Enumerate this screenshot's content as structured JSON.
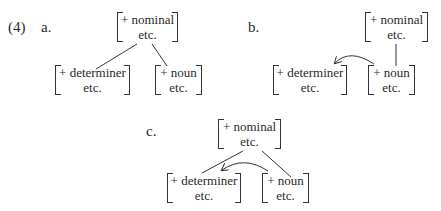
{
  "example": {
    "number": "(4)",
    "panels": [
      {
        "label": "a.",
        "top": {
          "feature": "+ nominal",
          "rest": "etc."
        },
        "left": {
          "feature": "+ determiner",
          "rest": "etc."
        },
        "right": {
          "feature": "+ noun",
          "rest": "etc."
        },
        "relation": "nominal dominates determiner and noun"
      },
      {
        "label": "b.",
        "top": {
          "feature": "+ nominal",
          "rest": "etc."
        },
        "left": {
          "feature": "+ determiner",
          "rest": "etc."
        },
        "right": {
          "feature": "+ noun",
          "rest": "etc."
        },
        "relation": "nominal dominates noun; arrow from noun to determiner"
      },
      {
        "label": "c.",
        "top": {
          "feature": "+ nominal",
          "rest": "etc."
        },
        "left": {
          "feature": "+ determiner",
          "rest": "etc."
        },
        "right": {
          "feature": "+ noun",
          "rest": "etc."
        },
        "relation": "nominal dominates determiner and noun; arrow from noun to determiner"
      }
    ]
  }
}
